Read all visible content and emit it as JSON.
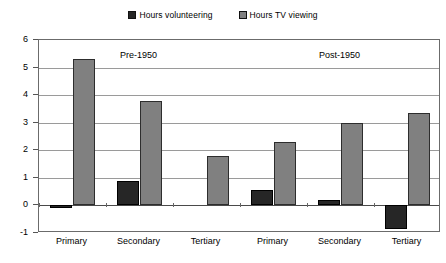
{
  "chart_data": {
    "type": "bar",
    "title": "",
    "subtitle": "",
    "xlabel": "",
    "ylabel": "",
    "ylim": [
      -1,
      6
    ],
    "yticks": [
      -1,
      0,
      1,
      2,
      3,
      4,
      5,
      6
    ],
    "ytick_labels": [
      "-1",
      "0",
      "1",
      "2",
      "3",
      "4",
      "5",
      "6"
    ],
    "grid": true,
    "legend_position": "top-center",
    "categories": [
      "Primary",
      "Secondary",
      "Tertiary",
      "Primary",
      "Secondary",
      "Tertiary"
    ],
    "series": [
      {
        "name": "Hours volunteering",
        "color": "#262626",
        "values": [
          -0.1,
          0.9,
          0,
          0.55,
          0.2,
          -0.85
        ]
      },
      {
        "name": "Hours TV viewing",
        "color": "#808080",
        "values": [
          5.3,
          3.8,
          1.8,
          2.3,
          3.0,
          3.35
        ]
      }
    ],
    "annotations": [
      {
        "text": "Pre-1950",
        "x_category_index": 1,
        "y": 5.6
      },
      {
        "text": "Post-1950",
        "x_category_index": 4,
        "y": 5.6
      }
    ]
  },
  "legend": {
    "items": [
      {
        "label": "Hours volunteering",
        "color": "#262626"
      },
      {
        "label": "Hours TV viewing",
        "color": "#808080"
      }
    ]
  },
  "axes": {
    "y_tick_labels": [
      "6",
      "5",
      "4",
      "3",
      "2",
      "1",
      "0",
      "-1"
    ],
    "x_tick_labels": [
      "Primary",
      "Secondary",
      "Tertiary",
      "Primary",
      "Secondary",
      "Tertiary"
    ]
  },
  "annotations": {
    "pre": "Pre-1950",
    "post": "Post-1950"
  },
  "colors": {
    "volunteering": "#262626",
    "tv": "#808080",
    "grid": "#9a9a9a",
    "frame": "#6b6b6b",
    "background": "#ffffff"
  }
}
